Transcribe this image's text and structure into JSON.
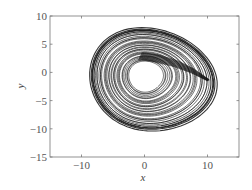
{
  "chart_data": {
    "type": "line",
    "title": "",
    "xlabel": "x",
    "ylabel": "y",
    "xlim": [
      -15,
      15
    ],
    "ylim": [
      -15,
      10
    ],
    "xticks": [
      -10,
      0,
      10
    ],
    "yticks": [
      10,
      5,
      0,
      -5,
      -10,
      -15
    ],
    "xtick_labels": [
      "−10",
      "0",
      "10"
    ],
    "ytick_labels": [
      "10",
      "5",
      "0",
      "−5",
      "−10",
      "−15"
    ],
    "grid": false,
    "legend": null,
    "line_color": "#111111",
    "series": [
      {
        "name": "phase-portrait-trajectory",
        "description": "chaotic attractor in x-y plane",
        "outer_bounds": {
          "x": [
            -9,
            11.5
          ],
          "y": [
            -10.5,
            7.5
          ]
        },
        "inner_hole_bounds": {
          "x": [
            -2.5,
            3
          ],
          "y": [
            -3.5,
            2
          ]
        },
        "fold_from": [
          -1,
          2
        ],
        "fold_to": [
          10,
          -1.5
        ]
      }
    ]
  }
}
